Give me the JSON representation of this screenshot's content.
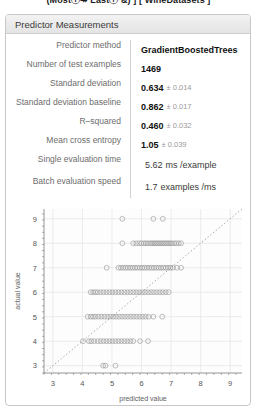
{
  "topline": {
    "text": "(Mostⓘ↠ Lastⓘ &) ] [ WineDatasets ]"
  },
  "panel": {
    "title": "Predictor Measurements",
    "rows": [
      {
        "label": "Predictor method",
        "value": "GradientBoostedTrees",
        "error": "",
        "unit": "",
        "bold": true
      },
      {
        "label": "Number of test examples",
        "value": "1469",
        "error": "",
        "unit": "",
        "bold": true
      },
      {
        "label": "Standard deviation",
        "value": "0.634",
        "error": "± 0.014",
        "unit": "",
        "bold": true
      },
      {
        "label": "Standard deviation baseline",
        "value": "0.862",
        "error": "± 0.017",
        "unit": "",
        "bold": true
      },
      {
        "label": "R–squared",
        "value": "0.460",
        "error": "± 0.032",
        "unit": "",
        "bold": true
      },
      {
        "label": "Mean cross entropy",
        "value": "1.05",
        "error": "± 0.039",
        "unit": "",
        "bold": true
      },
      {
        "label": "Single evaluation time",
        "value": "5.62",
        "error": "",
        "unit": "ms /example",
        "bold": false
      },
      {
        "label": "Batch evaluation speed",
        "value": "1.7",
        "error": "",
        "unit": "examples  /ms",
        "bold": false
      }
    ]
  },
  "chart_data": {
    "type": "scatter",
    "title": "",
    "xlabel": "predicted value",
    "ylabel": "actual value",
    "xlim": [
      2.7,
      9.4
    ],
    "ylim": [
      2.7,
      9.4
    ],
    "xticks": [
      3,
      4,
      5,
      6,
      7,
      8,
      9
    ],
    "yticks": [
      3,
      4,
      5,
      6,
      7,
      8,
      9
    ],
    "grid": true,
    "legend": null,
    "reference_line": {
      "type": "diagonal",
      "style": "dotted",
      "from": [
        2.7,
        2.7
      ],
      "to": [
        9.4,
        9.4
      ]
    },
    "marker": {
      "shape": "circle",
      "open": true,
      "color": "#8a8a8a",
      "size": 2.4
    },
    "series": [
      {
        "name": "actual vs predicted",
        "points_by_actual": [
          {
            "actual": 9,
            "x": [
              5.35,
              6.4,
              6.72
            ]
          },
          {
            "actual": 8,
            "x": [
              5.35,
              5.72,
              5.82,
              5.92,
              6.0,
              6.08,
              6.15,
              6.22,
              6.3,
              6.36,
              6.42,
              6.48,
              6.54,
              6.6,
              6.66,
              6.72,
              6.78,
              6.84,
              6.9,
              6.96,
              7.02,
              7.1,
              7.18,
              7.26,
              7.34
            ]
          },
          {
            "actual": 7,
            "x": [
              4.82,
              5.22,
              5.3,
              5.38,
              5.46,
              5.54,
              5.62,
              5.7,
              5.78,
              5.86,
              5.94,
              6.02,
              6.1,
              6.18,
              6.26,
              6.34,
              6.42,
              6.5,
              6.58,
              6.66,
              6.74,
              6.82,
              6.9,
              6.98,
              7.06,
              7.2,
              7.34
            ]
          },
          {
            "actual": 6,
            "x": [
              4.28,
              4.36,
              4.44,
              4.52,
              4.62,
              4.72,
              4.82,
              4.92,
              5.02,
              5.12,
              5.22,
              5.32,
              5.42,
              5.52,
              5.62,
              5.72,
              5.82,
              5.92,
              6.02,
              6.12,
              6.22,
              6.32,
              6.42,
              6.52,
              6.62,
              6.72,
              6.82,
              6.92
            ]
          },
          {
            "actual": 5,
            "x": [
              4.18,
              4.28,
              4.36,
              4.44,
              4.54,
              4.64,
              4.74,
              4.84,
              4.94,
              5.04,
              5.14,
              5.24,
              5.34,
              5.44,
              5.54,
              5.64,
              5.74,
              5.84,
              5.94,
              6.04,
              6.14,
              6.24,
              6.4,
              6.7
            ]
          },
          {
            "actual": 4,
            "x": [
              4.02,
              4.22,
              4.3,
              4.4,
              4.52,
              4.62,
              4.72,
              4.82,
              4.92,
              5.02,
              5.12,
              5.22,
              5.32,
              5.42,
              5.52,
              5.62,
              5.72,
              5.95,
              6.22
            ]
          },
          {
            "actual": 3,
            "x": [
              4.7,
              4.78,
              5.12
            ]
          }
        ]
      }
    ]
  }
}
